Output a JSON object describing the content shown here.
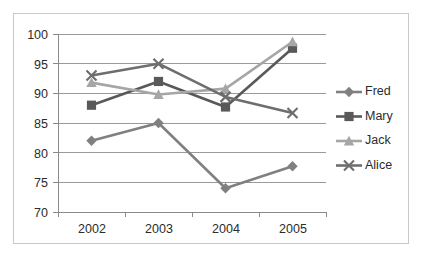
{
  "chart_data": {
    "type": "line",
    "title": "",
    "xlabel": "",
    "ylabel": "",
    "categories": [
      "2002",
      "2003",
      "2004",
      "2005"
    ],
    "ylim": [
      70,
      100
    ],
    "y_ticks": [
      "70",
      "75",
      "80",
      "85",
      "90",
      "95",
      "100"
    ],
    "grid": true,
    "legend_position": "right",
    "series": [
      {
        "name": "Fred",
        "marker": "diamond",
        "color": "#808080",
        "values": [
          82,
          85,
          74,
          77.7
        ]
      },
      {
        "name": "Mary",
        "marker": "square",
        "color": "#595959",
        "values": [
          88,
          92,
          87.7,
          97.6
        ]
      },
      {
        "name": "Jack",
        "marker": "triangle",
        "color": "#a6a6a6",
        "values": [
          91.8,
          89.8,
          90.8,
          98.7
        ]
      },
      {
        "name": "Alice",
        "marker": "x",
        "color": "#6e6e6e",
        "values": [
          93,
          95,
          89.4,
          86.7
        ]
      }
    ]
  },
  "legend": {
    "entries": [
      "Fred",
      "Mary",
      "Jack",
      "Alice"
    ]
  },
  "frame": {
    "border_color": "#c9c9c9",
    "background": "#ffffff"
  },
  "artifact": {
    "top_text": ""
  }
}
